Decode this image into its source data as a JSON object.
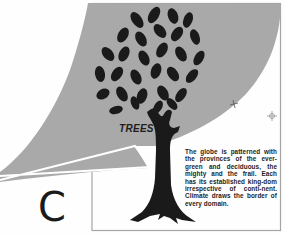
{
  "illustration": {
    "title": "TREES",
    "chapter_letter": "C",
    "caption": "The globe is patterned with the provinces of the ever-green and deciduous, the mighty and the frail. Each has its established king-dom irrespective of conti-nent. Climate draws the border of every domain.",
    "icons": [
      "tree-icon",
      "registration-mark-icon",
      "crosshair-icon"
    ],
    "colors": {
      "background": "#fefefe",
      "grey_sheet": "#a9a9a9",
      "tree": "#1a1a1a",
      "frame": "#a0a0a0"
    }
  }
}
